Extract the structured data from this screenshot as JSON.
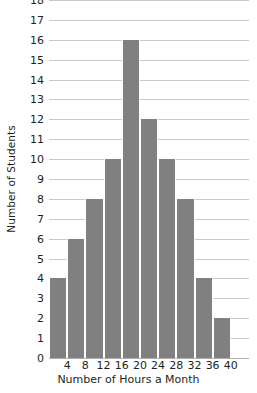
{
  "chart_data": {
    "type": "bar",
    "title": "",
    "xlabel": "Number of Hours a Month",
    "ylabel": "Number of Students",
    "categories": [
      "0-4",
      "4-8",
      "8-12",
      "12-16",
      "16-20",
      "20-24",
      "24-28",
      "28-32",
      "32-36",
      "36-40",
      "40-44"
    ],
    "values": [
      4,
      6,
      8,
      10,
      16,
      12,
      10,
      8,
      4,
      2,
      0
    ],
    "x_tick_labels": [
      "4",
      "8",
      "12",
      "16",
      "20",
      "24",
      "28",
      "32",
      "36",
      "40"
    ],
    "y_tick_labels": [
      "0",
      "1",
      "2",
      "3",
      "4",
      "5",
      "6",
      "7",
      "8",
      "9",
      "10",
      "11",
      "12",
      "13",
      "14",
      "15",
      "16",
      "17",
      "18"
    ],
    "ylim": [
      0,
      18
    ],
    "y_step": 1,
    "xlim": [
      0,
      44
    ],
    "x_step": 4,
    "grid": true,
    "legend": "none",
    "bar_color": "#808080",
    "gridline_color": "#c9c9c9",
    "axis_color": "#b0b0b0",
    "text_color": "#231f20",
    "background_color": "#ffffff"
  }
}
